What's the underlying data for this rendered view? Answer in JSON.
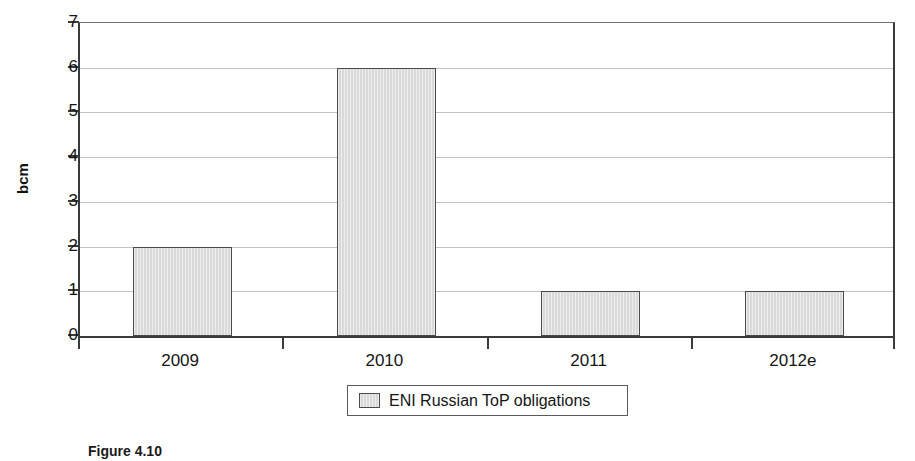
{
  "chart_data": {
    "type": "bar",
    "title": "",
    "subtitle": "",
    "xlabel": "",
    "ylabel": "bcm",
    "categories": [
      "2009",
      "2010",
      "2011",
      "2012e"
    ],
    "values": [
      2,
      6,
      1,
      1
    ],
    "series": [
      {
        "name": "ENI Russian ToP obligations",
        "values": [
          2,
          6,
          1,
          1
        ]
      }
    ],
    "ylim": [
      0,
      7
    ],
    "yticks": [
      0,
      1,
      2,
      3,
      4,
      5,
      6,
      7
    ],
    "ytick_labels": [
      "0",
      "1",
      "2",
      "3",
      "4",
      "5",
      "6",
      "7"
    ],
    "grid": true,
    "legend_position": "bottom",
    "legend_entries": [
      "ENI Russian ToP obligations"
    ],
    "bar_fill_color": "#d9d9d9",
    "bar_edge_color": "#4a4a4a",
    "axis_color": "#3a3a3a",
    "gridline_color": "#c2c2c2"
  },
  "axis": {
    "y_title": "bcm"
  },
  "legend": {
    "swatch_name": "legend-swatch",
    "label": "ENI Russian ToP obligations"
  },
  "caption": {
    "text": "Figure 4.10"
  }
}
